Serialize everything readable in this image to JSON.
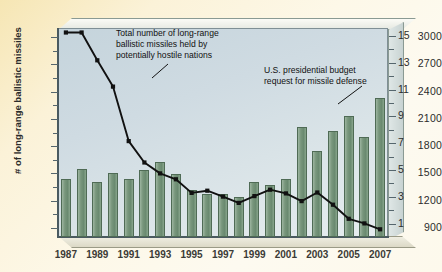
{
  "axes": {
    "left_title": "# of long-range ballistic missiles",
    "right_title": "Spending (in billions of U.S. dollars)",
    "left_ticks": [
      "900",
      "1200",
      "1500",
      "1800",
      "2100",
      "2400",
      "2700",
      "3000"
    ],
    "right_ticks": [
      "1",
      "3",
      "5",
      "7",
      "9",
      "11",
      "13",
      "15"
    ],
    "x_ticks": [
      "1987",
      "1989",
      "1991",
      "1993",
      "1995",
      "1997",
      "1999",
      "2001",
      "2003",
      "2005",
      "2007"
    ]
  },
  "annotations": {
    "line_note": "Total number of long-range\nballistic missiles held by\npotentially hostile nations",
    "bar_note": "U.S. presidential budget\nrequest for missile defense"
  },
  "colors": {
    "bar_fill": "#78967c",
    "bar_edge": "#4f6b55",
    "line": "#111111",
    "plot_bg": "#cfdbe2",
    "page_bg": "#fbf2d8"
  },
  "chart_data": {
    "type": "bar",
    "title": "",
    "xlabel": "",
    "ylabel": "# of long-range ballistic missiles",
    "grid": false,
    "legend_position": "none",
    "categories": [
      1987,
      1988,
      1989,
      1990,
      1991,
      1992,
      1993,
      1994,
      1995,
      1996,
      1997,
      1998,
      1999,
      2000,
      2001,
      2002,
      2003,
      2004,
      2005,
      2006,
      2007
    ],
    "ylim": [
      800,
      3100
    ],
    "y2lim": [
      0.0,
      15.6
    ],
    "series": [
      {
        "name": "U.S. presidential budget request for missile defense",
        "type": "bar",
        "axis": "right",
        "unit": "billions of U.S. dollars",
        "values": [
          4.3,
          5.1,
          4.1,
          4.8,
          4.3,
          5.0,
          5.6,
          4.7,
          3.5,
          3.2,
          3.2,
          3.0,
          4.1,
          3.9,
          4.3,
          8.2,
          6.4,
          7.9,
          9.0,
          7.5,
          10.4
        ]
      },
      {
        "name": "Total number of long-range ballistic missiles held by potentially hostile nations",
        "type": "line",
        "axis": "left",
        "unit": "missiles",
        "values": [
          3050,
          3050,
          2745,
          2455,
          1855,
          1620,
          1500,
          1435,
          1285,
          1310,
          1245,
          1175,
          1250,
          1320,
          1280,
          1195,
          1290,
          1155,
          1000,
          950,
          885
        ]
      }
    ]
  }
}
